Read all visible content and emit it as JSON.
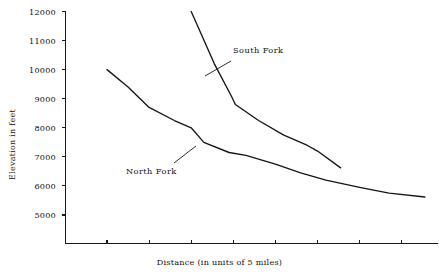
{
  "chart_data": {
    "type": "line",
    "title": "",
    "subtitle": "",
    "xlabel": "Distance (in units of 5 miles)",
    "ylabel": "Elevation in feet",
    "xlim": [
      0,
      9
    ],
    "ylim": [
      4300,
      12000
    ],
    "grid": false,
    "legend_position": "inline-annotations",
    "x_tick_labels": [
      "",
      "",
      "",
      "",
      "",
      "",
      "",
      ""
    ],
    "x_ticks": [
      1,
      2,
      3,
      4,
      5,
      6,
      7,
      8
    ],
    "y_ticks": [
      5000,
      6000,
      7000,
      8000,
      9000,
      10000,
      11000,
      12000
    ],
    "y_tick_labels": [
      "5000",
      "6000",
      "7000",
      "8000",
      "9000",
      "10000",
      "11000",
      "12000"
    ],
    "annotations": [
      {
        "text": "South Fork",
        "x": 4.8,
        "y": 10450
      },
      {
        "text": "North Fork",
        "x": 2.45,
        "y": 6250
      }
    ],
    "series": [
      {
        "name": "North Fork",
        "color": "#151515",
        "x": [
          1.0,
          1.5,
          2.0,
          2.6,
          3.0,
          3.3,
          3.9,
          4.3,
          5.0,
          5.6,
          6.2,
          7.0,
          7.7,
          8.55
        ],
        "y": [
          10000,
          9400,
          8700,
          8250,
          8000,
          7500,
          7150,
          7050,
          6750,
          6450,
          6200,
          5950,
          5750,
          5620
        ],
        "values": [
          10000,
          9400,
          8700,
          8250,
          8000,
          7500,
          7150,
          7050,
          6750,
          6450,
          6200,
          5950,
          5750,
          5620
        ]
      },
      {
        "name": "South Fork",
        "color": "#151515",
        "x": [
          3.0,
          3.55,
          3.95,
          4.05,
          4.6,
          5.2,
          5.75,
          6.0,
          6.55
        ],
        "y": [
          12000,
          10200,
          9100,
          8800,
          8250,
          7750,
          7400,
          7200,
          6620
        ],
        "values": [
          12000,
          10200,
          9100,
          8800,
          8250,
          7750,
          7400,
          7200,
          6620
        ]
      }
    ]
  },
  "axes": {
    "y_axis_name": "Elevation in feet",
    "x_axis_name": "Distance (in units of 5 miles)"
  }
}
